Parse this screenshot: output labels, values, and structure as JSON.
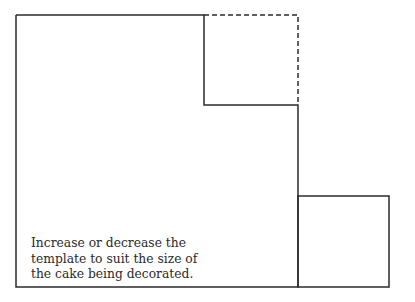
{
  "diagram": {
    "stroke_color": "#2b2b2b",
    "outline": {
      "description": "Main template outline (L-shape with step)",
      "points": [
        [
          16,
          15
        ],
        [
          204,
          15
        ],
        [
          204,
          105
        ],
        [
          298,
          105
        ],
        [
          298,
          287
        ],
        [
          16,
          287
        ]
      ]
    },
    "dashed_extension": {
      "description": "Optional extension shown with dashed line",
      "points": [
        [
          204,
          15
        ],
        [
          298,
          15
        ],
        [
          298,
          105
        ]
      ]
    },
    "side_piece": {
      "description": "Separate small square piece",
      "x": 298,
      "y": 196,
      "width": 91,
      "height": 91
    }
  },
  "caption": {
    "lines": [
      "Increase or decrease the",
      "template to suit the size of",
      "the cake being decorated."
    ]
  }
}
